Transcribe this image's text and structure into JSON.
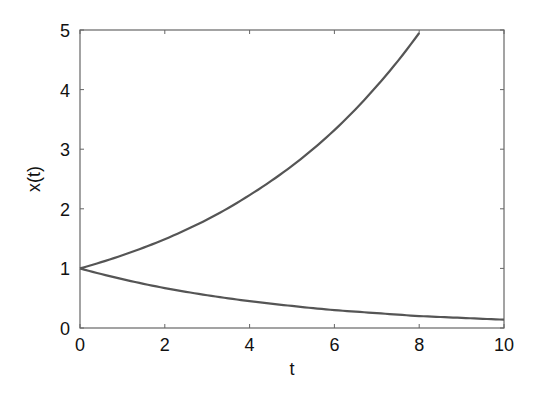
{
  "chart_data": {
    "type": "line",
    "title": "",
    "xlabel": "t",
    "ylabel": "x(t)",
    "xlim": [
      0,
      10
    ],
    "ylim": [
      0,
      5
    ],
    "xticks": [
      0,
      2,
      4,
      6,
      8,
      10
    ],
    "yticks": [
      0,
      1,
      2,
      3,
      4,
      5
    ],
    "grid": false,
    "legend": null,
    "line_color": "#555555",
    "series": [
      {
        "name": "growth",
        "formula": "x(t) = e^(0.2 t)",
        "x": [
          0,
          1,
          2,
          3,
          4,
          5,
          6,
          7,
          8
        ],
        "values": [
          1.0,
          1.22,
          1.49,
          1.82,
          2.23,
          2.72,
          3.32,
          4.06,
          4.95
        ]
      },
      {
        "name": "decay",
        "formula": "x(t) = e^(-0.2 t)",
        "x": [
          0,
          1,
          2,
          3,
          4,
          5,
          6,
          7,
          8,
          9,
          10
        ],
        "values": [
          1.0,
          0.82,
          0.67,
          0.55,
          0.45,
          0.37,
          0.3,
          0.25,
          0.2,
          0.17,
          0.14
        ]
      }
    ]
  }
}
